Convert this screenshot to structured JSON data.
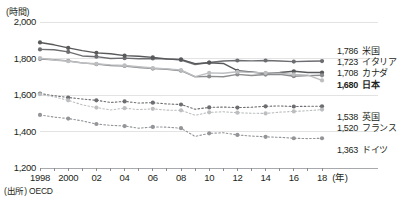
{
  "axis": {
    "unit_label": "(時間)",
    "y_ticks": [
      "2,000",
      "1,800",
      "1,600",
      "1,400",
      "1,200"
    ],
    "y_values": [
      2000,
      1800,
      1600,
      1400,
      1200
    ],
    "x_ticks": [
      "1998",
      "2000",
      "02",
      "04",
      "06",
      "08",
      "10",
      "12",
      "14",
      "16",
      "18"
    ],
    "x_tick_years": [
      1998,
      2000,
      2002,
      2004,
      2006,
      2008,
      2010,
      2012,
      2014,
      2016,
      2018
    ],
    "x_axis_unit": "(年)"
  },
  "source": "(出所) OECD",
  "end_labels": [
    {
      "value": "1,786",
      "name": "米国",
      "bold": false
    },
    {
      "value": "1,723",
      "name": "イタリア",
      "bold": false
    },
    {
      "value": "1,708",
      "name": "カナダ",
      "bold": false
    },
    {
      "value": "1,680",
      "name": "日本",
      "bold": true
    },
    {
      "value": "1,538",
      "name": "英国",
      "bold": false
    },
    {
      "value": "1,520",
      "name": "フランス",
      "bold": false
    },
    {
      "value": "1,363",
      "name": "ドイツ",
      "bold": false
    }
  ],
  "chart_data": {
    "type": "line",
    "title": "",
    "xlabel": "(年)",
    "ylabel": "(時間)",
    "xlim": [
      1998,
      2018
    ],
    "ylim": [
      1200,
      2000
    ],
    "grid": true,
    "legend_position": "right-end-labels",
    "x": [
      1998,
      1999,
      2000,
      2001,
      2002,
      2003,
      2004,
      2005,
      2006,
      2007,
      2008,
      2009,
      2010,
      2011,
      2012,
      2013,
      2014,
      2015,
      2016,
      2017,
      2018
    ],
    "series": [
      {
        "name": "米国",
        "color": "#6d6e71",
        "style": "solid",
        "final_value": 1786,
        "values": [
          1850,
          1848,
          1836,
          1814,
          1810,
          1800,
          1802,
          1799,
          1800,
          1798,
          1792,
          1767,
          1778,
          1786,
          1789,
          1787,
          1789,
          1786,
          1783,
          1785,
          1786
        ]
      },
      {
        "name": "イタリア",
        "color": "#58595b",
        "style": "solid",
        "final_value": 1723,
        "values": [
          1888,
          1875,
          1858,
          1843,
          1831,
          1826,
          1816,
          1812,
          1806,
          1797,
          1795,
          1772,
          1777,
          1773,
          1733,
          1726,
          1718,
          1723,
          1730,
          1723,
          1723
        ]
      },
      {
        "name": "カナダ",
        "color": "#8c8d8f",
        "style": "solid",
        "final_value": 1708,
        "values": [
          1797,
          1793,
          1787,
          1776,
          1769,
          1762,
          1759,
          1751,
          1745,
          1741,
          1733,
          1700,
          1702,
          1700,
          1713,
          1707,
          1712,
          1714,
          1703,
          1706,
          1708
        ]
      },
      {
        "name": "日本",
        "color": "#bcbec0",
        "style": "solid",
        "final_value": 1680,
        "values": [
          1802,
          1792,
          1785,
          1775,
          1771,
          1765,
          1762,
          1755,
          1748,
          1743,
          1737,
          1701,
          1721,
          1719,
          1727,
          1724,
          1721,
          1719,
          1713,
          1709,
          1680
        ]
      },
      {
        "name": "英国",
        "color": "#6d6e71",
        "style": "dashed",
        "final_value": 1538,
        "values": [
          1608,
          1596,
          1586,
          1578,
          1571,
          1559,
          1565,
          1556,
          1558,
          1551,
          1548,
          1522,
          1532,
          1534,
          1531,
          1533,
          1538,
          1540,
          1537,
          1538,
          1538
        ]
      },
      {
        "name": "フランス",
        "color": "#bcbec0",
        "style": "dashed",
        "final_value": 1520,
        "values": [
          1604,
          1590,
          1571,
          1546,
          1531,
          1518,
          1528,
          1520,
          1524,
          1517,
          1516,
          1489,
          1505,
          1508,
          1503,
          1500,
          1499,
          1506,
          1510,
          1514,
          1520
        ]
      },
      {
        "name": "ドイツ",
        "color": "#939598",
        "style": "dashed",
        "final_value": 1363,
        "values": [
          1491,
          1479,
          1471,
          1458,
          1441,
          1434,
          1430,
          1418,
          1425,
          1424,
          1418,
          1373,
          1390,
          1393,
          1381,
          1375,
          1371,
          1368,
          1363,
          1361,
          1363
        ]
      }
    ]
  }
}
